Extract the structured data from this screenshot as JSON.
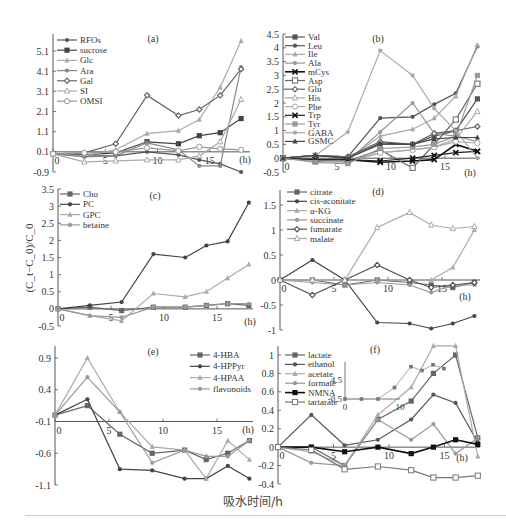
{
  "figure": {
    "shared_xlabel": "吸水时间/h",
    "shared_ylabel": "(C_t−C_0)/C_0",
    "x_unit": "(h)"
  },
  "chart_data": [
    {
      "panel": "(a)",
      "type": "line",
      "x": [
        0,
        3,
        6,
        9,
        12,
        14,
        16,
        18
      ],
      "xticks": [
        "0",
        "5",
        "10",
        "15"
      ],
      "yticks": [
        "5.1",
        "4.1",
        "3.1",
        "2.1",
        "1.1",
        "0.1",
        "-0.9"
      ],
      "ylim": [
        -0.9,
        5.7
      ],
      "series": [
        {
          "name": "RFOs",
          "values": [
            0,
            -0.1,
            -0.1,
            0.1,
            -0.05,
            -0.3,
            -0.5,
            -0.9
          ],
          "color": "#555",
          "marker": "dot"
        },
        {
          "name": "sucrose",
          "values": [
            0,
            -0.05,
            0.05,
            0.6,
            0.5,
            0.9,
            1.05,
            1.75
          ],
          "color": "#444",
          "marker": "square"
        },
        {
          "name": "Glc",
          "values": [
            0,
            -0.1,
            0.2,
            1.0,
            1.15,
            1.7,
            3.3,
            5.6
          ],
          "color": "#aaa",
          "marker": "triangle"
        },
        {
          "name": "Ara",
          "values": [
            0,
            -0.15,
            -0.1,
            0.55,
            0.2,
            -0.6,
            -0.6,
            4.3
          ],
          "color": "#888",
          "marker": "dot"
        },
        {
          "name": "Gal",
          "values": [
            0,
            0.05,
            0.5,
            2.9,
            1.9,
            2.2,
            2.9,
            4.2
          ],
          "color": "#666",
          "marker": "diamond"
        },
        {
          "name": "SI",
          "values": [
            0,
            -0.4,
            -0.35,
            -0.3,
            -0.3,
            -0.1,
            0.6,
            2.7
          ],
          "color": "#aaa",
          "marker": "open-triangle"
        },
        {
          "name": "OMSI",
          "values": [
            0,
            0.05,
            0.1,
            0.3,
            0.15,
            0.35,
            0.25,
            0.2
          ],
          "color": "#999",
          "marker": "open-circle"
        }
      ]
    },
    {
      "panel": "(b)",
      "type": "line",
      "x": [
        0,
        3,
        6,
        9,
        12,
        14,
        16,
        18
      ],
      "xticks": [
        "0",
        "5",
        "10",
        "15"
      ],
      "yticks": [
        "4.5",
        "4",
        "3.5",
        "3",
        "2.5",
        "2",
        "1.5",
        "1",
        "0.5",
        "0",
        "-0.5"
      ],
      "ylim": [
        -0.5,
        4.5
      ],
      "series": [
        {
          "name": "Val",
          "values": [
            0,
            0.1,
            0.0,
            0.5,
            0.5,
            0.8,
            1.0,
            2.15
          ],
          "color": "#555",
          "marker": "square"
        },
        {
          "name": "Leu",
          "values": [
            0,
            0.1,
            0.05,
            1.45,
            1.5,
            1.95,
            2.35,
            4.05
          ],
          "color": "#555",
          "marker": "dot"
        },
        {
          "name": "Ile",
          "values": [
            0,
            0.0,
            -0.05,
            0.8,
            1.05,
            1.45,
            2.25,
            4.1
          ],
          "color": "#aaa",
          "marker": "triangle"
        },
        {
          "name": "Ala",
          "values": [
            0,
            -0.1,
            -0.1,
            0.95,
            2.0,
            0.9,
            0.8,
            0.6
          ],
          "color": "#999",
          "marker": "dot"
        },
        {
          "name": "mCys",
          "values": [
            0,
            -0.05,
            -0.05,
            -0.15,
            -0.1,
            -0.05,
            0.5,
            0.25
          ],
          "color": "#111",
          "marker": "x"
        },
        {
          "name": "Asp",
          "values": [
            0,
            -0.1,
            -0.1,
            0.3,
            -0.35,
            0.5,
            1.4,
            2.7
          ],
          "color": "#666",
          "marker": "open-square"
        },
        {
          "name": "Glu",
          "values": [
            0,
            0.1,
            0.05,
            0.6,
            0.5,
            0.9,
            1.0,
            1.15
          ],
          "color": "#666",
          "marker": "diamond"
        },
        {
          "name": "His",
          "values": [
            0,
            -0.1,
            -0.15,
            0.2,
            0.3,
            0.4,
            0.7,
            1.7
          ],
          "color": "#aaa",
          "marker": "open-triangle"
        },
        {
          "name": "Phe",
          "values": [
            0,
            -0.05,
            -0.1,
            0.2,
            0.3,
            0.4,
            0.6,
            0.55
          ],
          "color": "#aaa",
          "marker": "open-circle"
        },
        {
          "name": "Trp",
          "values": [
            0,
            -0.05,
            -0.05,
            -0.1,
            0.0,
            0.1,
            0.2,
            0.25
          ],
          "color": "#222",
          "marker": "x"
        },
        {
          "name": "Tyr",
          "values": [
            0,
            -0.15,
            -0.2,
            0.35,
            0.4,
            0.5,
            0.8,
            3.0
          ],
          "color": "#999",
          "marker": "square"
        },
        {
          "name": "GABA",
          "values": [
            0,
            0.1,
            0.95,
            3.9,
            3.0,
            1.8,
            1.0,
            0.0
          ],
          "color": "#aaa",
          "marker": "dot"
        },
        {
          "name": "GSMC",
          "values": [
            0,
            0.1,
            0.0,
            0.55,
            0.5,
            0.7,
            0.75,
            0.75
          ],
          "color": "#444",
          "marker": "triangle"
        }
      ]
    },
    {
      "panel": "(c)",
      "type": "line",
      "x": [
        0,
        3,
        6,
        9,
        12,
        14,
        16,
        18
      ],
      "xticks": [
        "0",
        "5",
        "10",
        "15"
      ],
      "yticks": [
        "3.5",
        "3",
        "2.5",
        "2",
        "1.5",
        "1",
        "0.5",
        "0",
        "-0.5"
      ],
      "ylim": [
        -0.5,
        3.5
      ],
      "ylabel": "(C_t−C_0)/C_0",
      "series": [
        {
          "name": "Cho",
          "values": [
            0,
            0.05,
            -0.05,
            0.05,
            0.05,
            0.1,
            0.15,
            0.1
          ],
          "color": "#666",
          "marker": "square"
        },
        {
          "name": "PC",
          "values": [
            0,
            0.1,
            0.2,
            1.6,
            1.5,
            1.85,
            1.97,
            3.1
          ],
          "color": "#444",
          "marker": "dot"
        },
        {
          "name": "GPC",
          "values": [
            0,
            -0.2,
            -0.35,
            0.45,
            0.35,
            0.5,
            0.9,
            1.3
          ],
          "color": "#aaa",
          "marker": "triangle"
        },
        {
          "name": "betaine",
          "values": [
            0,
            -0.2,
            -0.25,
            0.05,
            0.05,
            0.1,
            0.15,
            0.15
          ],
          "color": "#999",
          "marker": "dot"
        }
      ]
    },
    {
      "panel": "(d)",
      "type": "line",
      "x": [
        0,
        3,
        6,
        9,
        12,
        14,
        16,
        18
      ],
      "xticks": [
        "0",
        "5",
        "10",
        "15"
      ],
      "yticks": [
        "1.5",
        "1",
        "0.5",
        "0",
        "-0.5",
        "-1"
      ],
      "ylim": [
        -1,
        1.7
      ],
      "series": [
        {
          "name": "citrate",
          "values": [
            0,
            0.0,
            -0.1,
            0.0,
            -0.05,
            -0.1,
            -0.15,
            -0.05
          ],
          "color": "#666",
          "marker": "square"
        },
        {
          "name": "cis-aconitate",
          "values": [
            0,
            0.0,
            -0.15,
            -0.85,
            -0.87,
            -0.97,
            -0.87,
            -0.72
          ],
          "color": "#444",
          "marker": "dot"
        },
        {
          "name": "α-KG",
          "values": [
            0,
            0.0,
            0.0,
            0.0,
            0.0,
            0.0,
            0.25,
            1.0
          ],
          "color": "#aaa",
          "marker": "triangle"
        },
        {
          "name": "succinate",
          "values": [
            0,
            -0.05,
            -0.1,
            -0.05,
            -0.1,
            -0.25,
            -0.1,
            -0.1
          ],
          "color": "#999",
          "marker": "dot"
        },
        {
          "name": "fumarate",
          "values": [
            0,
            -0.3,
            0.0,
            0.3,
            0.0,
            -0.15,
            -0.1,
            -0.05
          ],
          "color": "#555",
          "marker": "diamond"
        },
        {
          "name": "malate",
          "values": [
            0,
            0.0,
            0.0,
            1.05,
            1.35,
            1.1,
            1.03,
            1.07
          ],
          "color": "#aaa",
          "marker": "open-triangle"
        }
      ],
      "extra_series_note": "cis-aconitate first rises to 0.4 at x=3",
      "cis_aconitate_peak": {
        "x": 3,
        "y": 0.4
      }
    },
    {
      "panel": "(e)",
      "type": "line",
      "x": [
        0,
        3,
        6,
        9,
        12,
        14,
        16,
        18
      ],
      "xticks": [
        "0",
        "5",
        "10",
        "15"
      ],
      "yticks": [
        "0.9",
        "0.4",
        "-0.1",
        "-0.6",
        "-1.1"
      ],
      "ylim": [
        -1.1,
        1.0
      ],
      "series": [
        {
          "name": "4-HBA",
          "values": [
            0,
            0.15,
            -0.3,
            -0.6,
            -0.55,
            -0.7,
            -0.6,
            -0.4
          ],
          "color": "#666",
          "marker": "square"
        },
        {
          "name": "4-HPPyr",
          "values": [
            0,
            0.25,
            -0.85,
            -0.87,
            -1.0,
            -1.0,
            -0.8,
            -1.0
          ],
          "color": "#444",
          "marker": "dot"
        },
        {
          "name": "4-HPAA",
          "values": [
            0,
            0.9,
            0.05,
            -0.5,
            -0.55,
            -1.0,
            -0.4,
            -0.7
          ],
          "color": "#aaa",
          "marker": "triangle"
        },
        {
          "name": "flavonoids",
          "values": [
            0,
            0.6,
            0.05,
            -0.75,
            -0.55,
            -0.65,
            -0.65,
            -0.4
          ],
          "color": "#999",
          "marker": "dot"
        }
      ]
    },
    {
      "panel": "(f)",
      "type": "line",
      "x": [
        0,
        3,
        6,
        9,
        12,
        14,
        16,
        18
      ],
      "xticks": [
        "0",
        "5",
        "10",
        "15"
      ],
      "yticks": [
        "1",
        "0.8",
        "0.6",
        "0.4",
        "0.2",
        "0",
        "-0.2",
        "-0.4"
      ],
      "ylim": [
        -0.4,
        1.1
      ],
      "series": [
        {
          "name": "lactate",
          "values": [
            0,
            0.0,
            -0.2,
            0.3,
            0.5,
            0.8,
            1.0,
            0.1
          ],
          "color": "#666",
          "marker": "square"
        },
        {
          "name": "ethanol",
          "values": [
            0,
            0.35,
            0.02,
            0.08,
            0.3,
            0.57,
            0.48,
            0.05
          ],
          "color": "#555",
          "marker": "dot"
        },
        {
          "name": "acetate",
          "values": [
            0,
            -0.05,
            -0.2,
            0.35,
            0.65,
            1.1,
            1.1,
            -0.1
          ],
          "color": "#aaa",
          "marker": "triangle"
        },
        {
          "name": "formate",
          "values": [
            0,
            -0.17,
            -0.2,
            0.3,
            0.08,
            0.25,
            -0.07,
            0.1
          ],
          "color": "#999",
          "marker": "dot"
        },
        {
          "name": "NMNA",
          "values": [
            0,
            0.0,
            -0.05,
            0.0,
            -0.07,
            0.0,
            0.08,
            0.03
          ],
          "color": "#111",
          "marker": "filled-square"
        },
        {
          "name": "tartarate",
          "values": [
            0,
            -0.03,
            -0.24,
            -0.21,
            -0.25,
            -0.33,
            -0.33,
            -0.31
          ],
          "color": "#777",
          "marker": "open-square"
        }
      ],
      "inset": {
        "series_name": "lactate",
        "x": [
          0,
          3,
          6,
          9,
          12,
          14,
          16,
          18
        ],
        "values": [
          -0.5,
          -0.5,
          -0.5,
          2.5,
          8.0,
          7.0,
          8.5,
          7.5
        ],
        "yticks": [
          "4.5",
          "-0.5"
        ],
        "xticks": [
          "0",
          "10"
        ]
      }
    }
  ]
}
